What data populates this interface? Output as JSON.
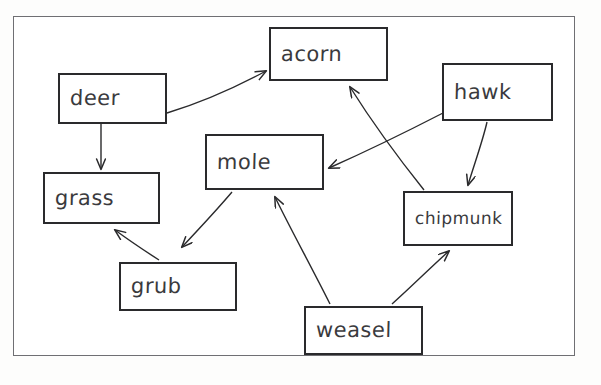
{
  "diagram": {
    "style": "hand-drawn boxes and arrows on white paper",
    "frame": {
      "name": "outer-border",
      "color": "#6f6f73"
    },
    "node_color": "#2a2a2c",
    "text_color": "#3a3a3d",
    "nodes": [
      {
        "id": "deer",
        "label": "deer",
        "x": 58,
        "y": 73,
        "w": 109,
        "h": 51
      },
      {
        "id": "acorn",
        "label": "acorn",
        "x": 269,
        "y": 27,
        "w": 119,
        "h": 54
      },
      {
        "id": "hawk",
        "label": "hawk",
        "x": 442,
        "y": 63,
        "w": 111,
        "h": 58
      },
      {
        "id": "grass",
        "label": "grass",
        "x": 43,
        "y": 172,
        "w": 117,
        "h": 52
      },
      {
        "id": "mole",
        "label": "mole",
        "x": 205,
        "y": 134,
        "w": 119,
        "h": 56
      },
      {
        "id": "chipmunk",
        "label": "chipmunk",
        "x": 403,
        "y": 191,
        "w": 110,
        "h": 55
      },
      {
        "id": "grub",
        "label": "grub",
        "x": 119,
        "y": 262,
        "w": 118,
        "h": 49
      },
      {
        "id": "weasel",
        "label": "weasel",
        "x": 304,
        "y": 306,
        "w": 119,
        "h": 49
      }
    ],
    "edges": [
      {
        "id": "deer-acorn",
        "from": "deer",
        "to": "acorn",
        "label": ""
      },
      {
        "id": "deer-grass",
        "from": "deer",
        "to": "grass",
        "label": ""
      },
      {
        "id": "chipmunk-acorn",
        "from": "chipmunk",
        "to": "acorn",
        "label": ""
      },
      {
        "id": "hawk-mole",
        "from": "hawk",
        "to": "mole",
        "label": ""
      },
      {
        "id": "hawk-chipmunk",
        "from": "hawk",
        "to": "chipmunk",
        "label": ""
      },
      {
        "id": "mole-grub",
        "from": "mole",
        "to": "grub",
        "label": ""
      },
      {
        "id": "grub-grass",
        "from": "grub",
        "to": "grass",
        "label": ""
      },
      {
        "id": "weasel-mole",
        "from": "weasel",
        "to": "mole",
        "label": ""
      },
      {
        "id": "weasel-chipmunk",
        "from": "weasel",
        "to": "chipmunk",
        "label": ""
      }
    ]
  }
}
